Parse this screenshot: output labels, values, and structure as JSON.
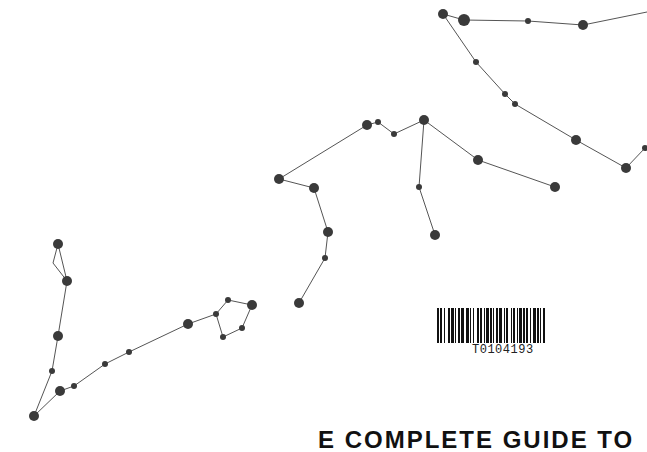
{
  "cover": {
    "title_partial": "E COMPLETE GUIDE TO",
    "barcode_number": "T0104193"
  },
  "colors": {
    "star": "#3a3a3a",
    "line": "#555555",
    "background": "#ffffff"
  },
  "constellations": [
    {
      "name": "upper-right",
      "stars": [
        [
          443,
          14,
          5
        ],
        [
          464,
          20,
          6
        ],
        [
          528,
          21,
          3
        ],
        [
          583,
          25,
          5
        ],
        [
          647,
          12,
          0
        ],
        [
          476,
          62,
          3
        ],
        [
          505,
          94,
          3
        ],
        [
          515,
          104,
          3
        ],
        [
          576,
          140,
          5
        ],
        [
          626,
          168,
          5
        ],
        [
          645,
          148,
          3
        ]
      ],
      "edges": [
        [
          0,
          1
        ],
        [
          1,
          2
        ],
        [
          2,
          3
        ],
        [
          3,
          4
        ],
        [
          0,
          5
        ],
        [
          5,
          6
        ],
        [
          6,
          7
        ],
        [
          7,
          8
        ],
        [
          8,
          9
        ],
        [
          9,
          10
        ]
      ]
    },
    {
      "name": "middle",
      "stars": [
        [
          279,
          179,
          5
        ],
        [
          314,
          188,
          5
        ],
        [
          328,
          232,
          5
        ],
        [
          325,
          258,
          3
        ],
        [
          299,
          303,
          5
        ],
        [
          367,
          125,
          5
        ],
        [
          378,
          122,
          3
        ],
        [
          394,
          134,
          3
        ],
        [
          424,
          120,
          5
        ],
        [
          419,
          187,
          3
        ],
        [
          435,
          235,
          5
        ],
        [
          478,
          160,
          5
        ],
        [
          555,
          187,
          5
        ]
      ],
      "edges": [
        [
          0,
          1
        ],
        [
          1,
          2
        ],
        [
          2,
          3
        ],
        [
          3,
          4
        ],
        [
          0,
          5
        ],
        [
          5,
          6
        ],
        [
          6,
          7
        ],
        [
          7,
          8
        ],
        [
          8,
          9
        ],
        [
          9,
          10
        ],
        [
          8,
          11
        ],
        [
          11,
          12
        ]
      ]
    },
    {
      "name": "lower-left",
      "stars": [
        [
          58,
          244,
          5
        ],
        [
          53,
          263,
          0
        ],
        [
          67,
          281,
          5
        ],
        [
          58,
          336,
          5
        ],
        [
          52,
          371,
          3
        ],
        [
          34,
          416,
          5
        ],
        [
          60,
          391,
          5
        ],
        [
          74,
          386,
          3
        ],
        [
          105,
          364,
          3
        ],
        [
          129,
          352,
          3
        ],
        [
          188,
          324,
          5
        ],
        [
          216,
          314,
          3
        ],
        [
          228,
          300,
          3
        ],
        [
          252,
          305,
          5
        ],
        [
          242,
          328,
          3
        ],
        [
          223,
          337,
          3
        ]
      ],
      "edges": [
        [
          0,
          1
        ],
        [
          1,
          2
        ],
        [
          0,
          2
        ],
        [
          2,
          3
        ],
        [
          3,
          4
        ],
        [
          4,
          5
        ],
        [
          5,
          6
        ],
        [
          6,
          7
        ],
        [
          7,
          8
        ],
        [
          8,
          9
        ],
        [
          9,
          10
        ],
        [
          10,
          11
        ],
        [
          11,
          12
        ],
        [
          12,
          13
        ],
        [
          13,
          14
        ],
        [
          14,
          15
        ],
        [
          15,
          11
        ]
      ]
    }
  ]
}
